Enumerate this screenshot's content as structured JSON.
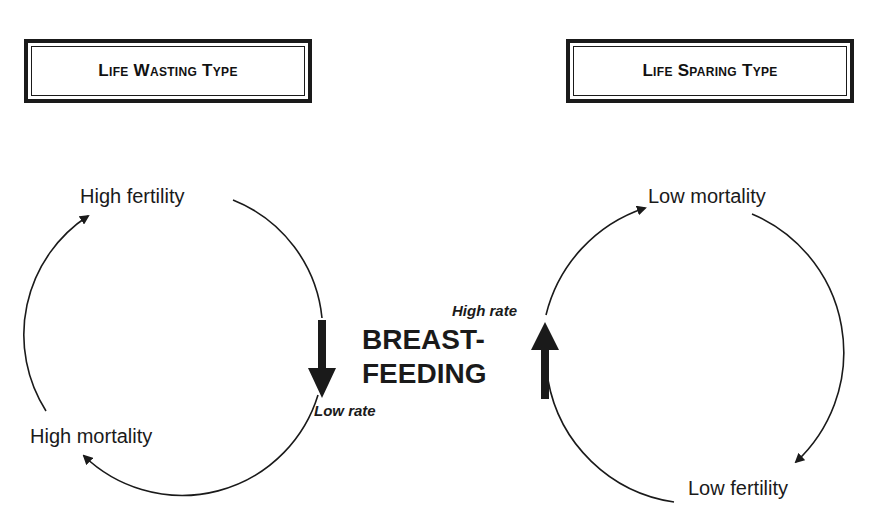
{
  "left_panel": {
    "title": "Life Wasting Type",
    "nodes": {
      "top": "High fertility",
      "bottom_left": "High mortality"
    },
    "rate_label": "Low rate",
    "arrow_direction": "down"
  },
  "right_panel": {
    "title": "Life Sparing Type",
    "nodes": {
      "top": "Low mortality",
      "bottom_right": "Low fertility"
    },
    "rate_label": "High rate",
    "arrow_direction": "up"
  },
  "center": {
    "line1": "BREAST-",
    "line2": "FEEDING"
  },
  "colors": {
    "ink": "#1a1a1a",
    "background": "#ffffff"
  }
}
